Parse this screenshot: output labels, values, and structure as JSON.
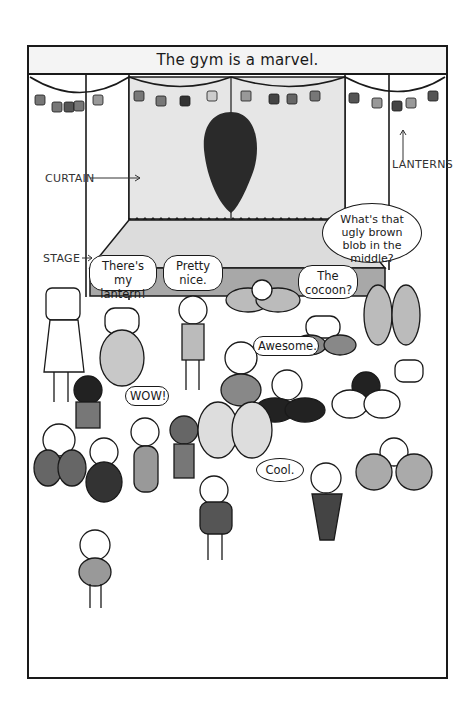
{
  "caption": "The gym is a marvel.",
  "labels": {
    "curtain": "CURTAIN",
    "lanterns": "LANTERNS",
    "stage": "STAGE"
  },
  "bubbles": {
    "theres_my_lantern": "There's my lantern!",
    "pretty_nice": "Pretty nice.",
    "the_cocoon": "The cocoon?",
    "ugly_blob": "What's that ugly brown blob in the middle?",
    "awesome": "Awesome.",
    "wow": "WOW!",
    "cool": "Cool."
  },
  "colors": {
    "ink": "#1a1a1a",
    "curtain": "#e6e6e6",
    "stage_top": "#dcdcdc",
    "stage_front": "#a8a8a8",
    "cocoon": "#2a2a2a",
    "caption_bg": "#f4f4f4"
  }
}
